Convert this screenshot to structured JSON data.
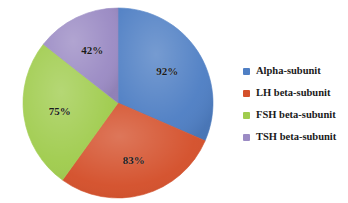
{
  "chart_data": {
    "type": "pie",
    "title": "",
    "xlabel": "",
    "ylabel": "",
    "legend_position": "right",
    "grid": false,
    "categories": [
      "Alpha-subunit",
      "LH beta-subunit",
      "FSH beta-subunit",
      "TSH beta-subunit"
    ],
    "values": [
      92,
      83,
      75,
      42
    ],
    "value_labels": [
      "92%",
      "83%",
      "75%",
      "42%"
    ],
    "colors": [
      "#4F7FC4",
      "#D4502B",
      "#A0CC4E",
      "#9B8BC4"
    ],
    "slices": [
      {
        "label": "Alpha-subunit",
        "value": 92,
        "value_label": "92%",
        "color": "#4F7FC4"
      },
      {
        "label": "LH beta-subunit",
        "value": 83,
        "value_label": "83%",
        "color": "#D4502B"
      },
      {
        "label": "FSH beta-subunit",
        "value": 75,
        "value_label": "75%",
        "color": "#A0CC4E"
      },
      {
        "label": "TSH beta-subunit",
        "value": 42,
        "value_label": "42%",
        "color": "#9B8BC4"
      }
    ]
  },
  "legend": {
    "items": [
      {
        "label": "Alpha-subunit",
        "color": "#4F7FC4"
      },
      {
        "label": "LH beta-subunit",
        "color": "#D4502B"
      },
      {
        "label": "FSH beta-subunit",
        "color": "#A0CC4E"
      },
      {
        "label": "TSH beta-subunit",
        "color": "#9B8BC4"
      }
    ]
  }
}
